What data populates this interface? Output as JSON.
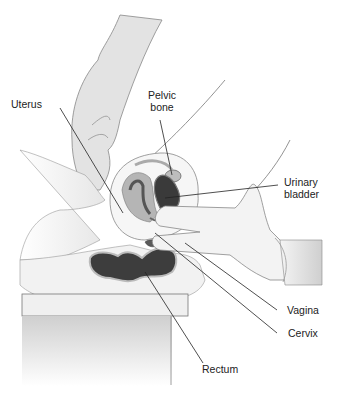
{
  "figure": {
    "labels": [
      {
        "id": "uterus",
        "text": "Uterus"
      },
      {
        "id": "pelvic-bone",
        "line1": "Pelvic",
        "line2": "bone"
      },
      {
        "id": "urinary-bladder",
        "line1": "Urinary",
        "line2": "bladder"
      },
      {
        "id": "vagina",
        "text": "Vagina"
      },
      {
        "id": "cervix",
        "text": "Cervix"
      },
      {
        "id": "rectum",
        "text": "Rectum"
      }
    ]
  }
}
